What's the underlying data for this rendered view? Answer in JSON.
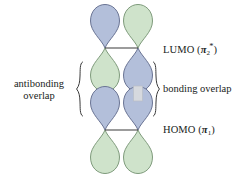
{
  "figure": {
    "background_color": "#ffffff",
    "width": 249,
    "height": 177
  },
  "colors": {
    "lobe_blue_fill": "#b3bfda",
    "lobe_blue_stroke": "#6a7494",
    "lobe_green_fill": "#cfe3cb",
    "lobe_green_stroke": "#7f9b7c",
    "node_line": "#3a3a3a",
    "overlap_band": "#d6d9de",
    "overlap_band_stroke": "#b9bec7",
    "brace": "#3a3a3a",
    "text": "#201d1b"
  },
  "labels": {
    "lumo": {
      "name": "LUMO",
      "open_paren": "(",
      "symbol": "π",
      "subscript": "2",
      "superscript": "*",
      "close_paren": ")"
    },
    "homo": {
      "name": "HOMO",
      "open_paren": "(",
      "symbol": "π",
      "subscript": "1",
      "superscript": "",
      "close_paren": ")"
    },
    "antibonding": {
      "line1": "antibonding",
      "line2": "overlap"
    },
    "bonding": {
      "line1": "bonding overlap"
    }
  },
  "orbitals": [
    {
      "id": "lumo",
      "label_ref": "lumo",
      "node_y": 48,
      "columns": [
        {
          "id": "lumo-left",
          "center_x": 105,
          "top_lobe_color": "blue",
          "bottom_lobe_color": "green"
        },
        {
          "id": "lumo-right",
          "center_x": 138,
          "top_lobe_color": "green",
          "bottom_lobe_color": "blue"
        }
      ]
    },
    {
      "id": "homo",
      "label_ref": "homo",
      "node_y": 130,
      "columns": [
        {
          "id": "homo-left",
          "center_x": 105,
          "top_lobe_color": "blue",
          "bottom_lobe_color": "green"
        },
        {
          "id": "homo-right",
          "center_x": 138,
          "top_lobe_color": "blue",
          "bottom_lobe_color": "green"
        }
      ]
    }
  ],
  "overlap_regions": [
    {
      "id": "antibonding-overlap",
      "column": "left",
      "center_x": 105,
      "type": "antibonding",
      "has_connecting_band": false,
      "caption_ref": "antibonding",
      "brace_side": "left",
      "brace_x": 79,
      "brace_top": 62,
      "brace_bottom": 116
    },
    {
      "id": "bonding-overlap",
      "column": "right",
      "center_x": 138,
      "type": "bonding",
      "has_connecting_band": true,
      "caption_ref": "bonding",
      "brace_side": "right",
      "brace_x": 156,
      "brace_top": 62,
      "brace_bottom": 116
    }
  ]
}
